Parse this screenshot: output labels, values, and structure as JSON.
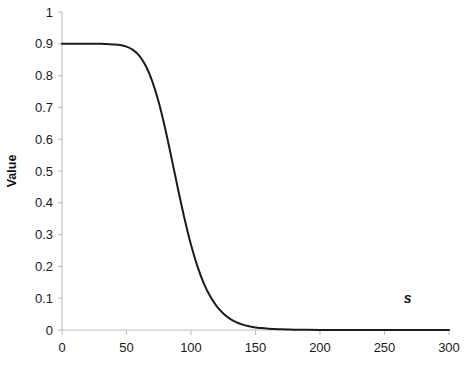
{
  "chart_data": {
    "type": "line",
    "title": "",
    "subtitle": "",
    "xlabel": "",
    "ylabel": "Value",
    "xlim": [
      0,
      300
    ],
    "ylim": [
      0,
      1
    ],
    "grid": false,
    "legend": null,
    "x_ticks": [
      0,
      50,
      100,
      150,
      200,
      250,
      300
    ],
    "x_tick_labels": [
      "0",
      "50",
      "100",
      "150",
      "200",
      "250",
      "300"
    ],
    "y_ticks": [
      0,
      0.1,
      0.2,
      0.3,
      0.4,
      0.5,
      0.6,
      0.7,
      0.8,
      0.9,
      1
    ],
    "y_tick_labels": [
      "0",
      "0.1",
      "0.2",
      "0.3",
      "0.4",
      "0.5",
      "0.6",
      "0.7",
      "0.8",
      "0.9",
      "1"
    ],
    "annotations": [
      {
        "text": "s",
        "x": 268,
        "y": 0.085,
        "style": "bold-italic"
      }
    ],
    "series": [
      {
        "name": "value-curve",
        "color": "#1c1c1c",
        "x": [
          0,
          5,
          10,
          15,
          20,
          25,
          30,
          35,
          40,
          45,
          50,
          55,
          60,
          65,
          70,
          75,
          80,
          85,
          90,
          95,
          100,
          105,
          110,
          115,
          120,
          125,
          130,
          135,
          140,
          145,
          150,
          155,
          160,
          165,
          170,
          175,
          180,
          190,
          200,
          210,
          220,
          230,
          240,
          250,
          260,
          270,
          280,
          290,
          300
        ],
        "values": [
          0.9,
          0.9,
          0.9,
          0.9,
          0.9,
          0.9,
          0.9,
          0.899,
          0.898,
          0.896,
          0.891,
          0.881,
          0.862,
          0.83,
          0.782,
          0.716,
          0.633,
          0.539,
          0.442,
          0.35,
          0.268,
          0.2,
          0.146,
          0.105,
          0.074,
          0.052,
          0.036,
          0.025,
          0.017,
          0.012,
          0.008,
          0.006,
          0.004,
          0.003,
          0.002,
          0.0014,
          0.001,
          0.0005,
          0.0003,
          0.0002,
          0.0001,
          0.0001,
          0.0,
          0.0,
          0.0,
          0.0,
          0.0,
          0.0,
          0.0
        ]
      }
    ]
  },
  "axes": {
    "y_axis_title": "Value",
    "x_axis_title": ""
  }
}
